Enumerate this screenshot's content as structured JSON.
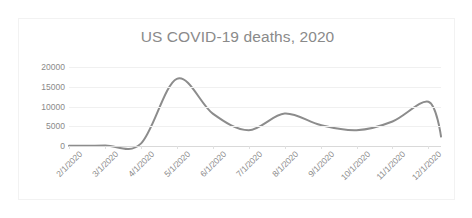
{
  "chart_data": {
    "type": "line",
    "title": "US COVID-19 deaths, 2020",
    "xlabel": "",
    "ylabel": "",
    "grid": true,
    "legend": false,
    "legend_position": "none",
    "line_color": "#8c8c8c",
    "gridline_color": "#f0f0f0",
    "axis_color": "#d9d9d9",
    "text_color": "#8a8a8a",
    "ylim": [
      0,
      20000
    ],
    "ytick_labels": [
      "20000",
      "15000",
      "10000",
      "5000",
      "0"
    ],
    "ytick_values": [
      20000,
      15000,
      10000,
      5000,
      0
    ],
    "categories": [
      "2/1/2020",
      "3/1/2020",
      "4/1/2020",
      "5/1/2020",
      "6/1/2020",
      "7/1/2020",
      "8/1/2020",
      "9/1/2020",
      "10/1/2020",
      "11/1/2020",
      "12/1/2020"
    ],
    "series": [
      {
        "name": "US COVID-19 deaths",
        "values": [
          60,
          120,
          600,
          17000,
          8200,
          4000,
          8200,
          5300,
          4000,
          6200,
          11200
        ]
      }
    ],
    "annotations": {
      "spring_peak": "17000",
      "summer_trough": "3800",
      "summer_peak": "8200",
      "autumn_trough": "3900",
      "winter_peak": "11200",
      "final_value": "2400"
    }
  }
}
